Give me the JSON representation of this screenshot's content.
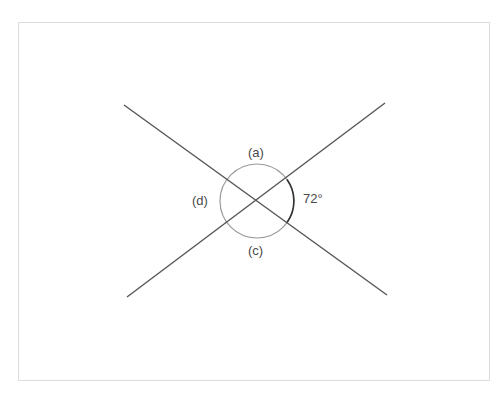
{
  "diagram": {
    "lines": [
      {
        "name": "line-1",
        "x1": 124,
        "y1": 105,
        "x2": 387,
        "y2": 295
      },
      {
        "name": "line-2",
        "x1": 127,
        "y1": 297,
        "x2": 385,
        "y2": 103
      }
    ],
    "intersection": {
      "x": 257,
      "y": 201
    },
    "angle_circle_radius": 37,
    "labels": {
      "a": "(a)",
      "b": "72°",
      "c": "(c)",
      "d": "(d)"
    },
    "given_angle_degrees": 72,
    "colors": {
      "line": "#555555",
      "circle": "#9a9a9a",
      "marked_arc": "#333333",
      "label": "#4a4a4a",
      "frame": "#dcdcdc"
    }
  }
}
